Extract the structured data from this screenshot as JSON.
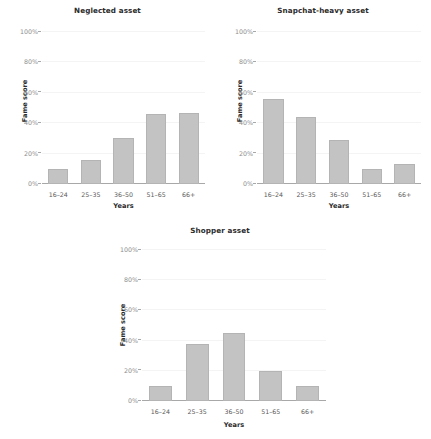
{
  "chart_data": [
    {
      "type": "bar",
      "title": "Neglected asset",
      "xlabel": "Years",
      "ylabel": "Fame score",
      "categories": [
        "16–24",
        "25–35",
        "36–50",
        "51–65",
        "66+"
      ],
      "values": [
        10,
        16,
        30,
        46,
        47
      ],
      "ylim": [
        0,
        100
      ],
      "yticks": [
        0,
        20,
        40,
        60,
        80,
        100
      ],
      "ytick_labels": [
        "0%",
        "20%",
        "40%",
        "60%",
        "80%",
        "100%"
      ],
      "grid": true,
      "legend": "none",
      "bar_color": "#c3c3c3"
    },
    {
      "type": "bar",
      "title": "Snapchat-heavy asset",
      "xlabel": "Years",
      "ylabel": "Fame score",
      "categories": [
        "16–24",
        "25–35",
        "36–50",
        "51–65",
        "66+"
      ],
      "values": [
        56,
        44,
        29,
        10,
        13
      ],
      "ylim": [
        0,
        100
      ],
      "yticks": [
        0,
        20,
        40,
        60,
        80,
        100
      ],
      "ytick_labels": [
        "0%",
        "20%",
        "40%",
        "60%",
        "80%",
        "100%"
      ],
      "grid": true,
      "legend": "none",
      "bar_color": "#c3c3c3"
    },
    {
      "type": "bar",
      "title": "Shopper asset",
      "xlabel": "Years",
      "ylabel": "Fame score",
      "categories": [
        "16–24",
        "25–35",
        "36–50",
        "51–65",
        "66+"
      ],
      "values": [
        10,
        38,
        45,
        20,
        10
      ],
      "ylim": [
        0,
        100
      ],
      "yticks": [
        0,
        20,
        40,
        60,
        80,
        100
      ],
      "ytick_labels": [
        "0%",
        "20%",
        "40%",
        "60%",
        "80%",
        "100%"
      ],
      "grid": true,
      "legend": "none",
      "bar_color": "#c3c3c3"
    }
  ]
}
